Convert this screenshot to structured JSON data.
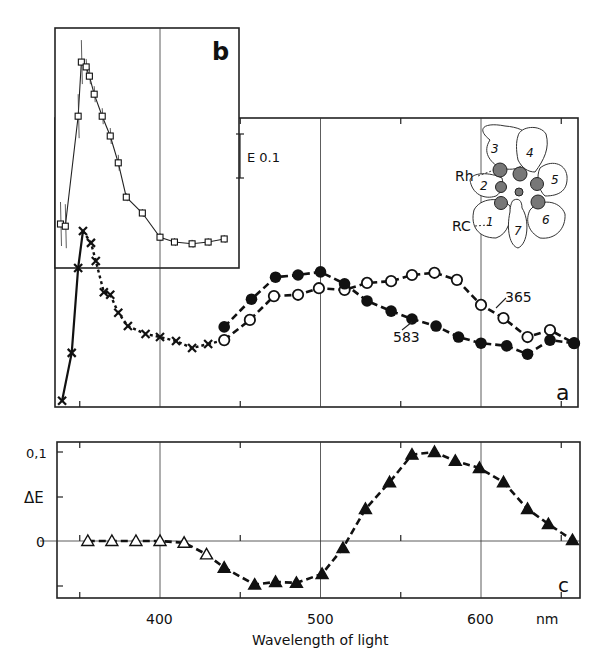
{
  "chart_data": [
    {
      "panel": "a",
      "type": "line",
      "title": "",
      "panel_label": "a",
      "xlabel": "Wavelength of light",
      "xunit": "nm",
      "ylabel": "E (relative extinction)",
      "xlim": [
        335,
        665
      ],
      "scale_bar": {
        "label": "E 0.1",
        "value": 0.1
      },
      "x_gridlines": [
        400,
        500,
        600
      ],
      "x_minor_ticks": [
        350,
        450,
        550,
        650
      ],
      "series": [
        {
          "name": "UV (x) both",
          "marker": "x",
          "x": [
            339,
            345,
            349,
            352,
            357,
            360,
            365,
            369,
            374,
            380,
            391,
            400,
            410,
            420,
            430
          ],
          "values": [
            0.014,
            0.123,
            0.316,
            0.4,
            0.373,
            0.332,
            0.261,
            0.255,
            0.214,
            0.184,
            0.166,
            0.159,
            0.15,
            0.134,
            0.143
          ]
        },
        {
          "name": "583",
          "marker": "filled-circle",
          "x": [
            440,
            457,
            472,
            486,
            500,
            515,
            529,
            544,
            557,
            572,
            586,
            600,
            616,
            629,
            643,
            658
          ],
          "values": [
            0.182,
            0.245,
            0.295,
            0.3,
            0.307,
            0.28,
            0.241,
            0.218,
            0.2,
            0.184,
            0.159,
            0.145,
            0.139,
            0.12,
            0.152,
            0.145
          ]
        },
        {
          "name": "365",
          "marker": "open-circle",
          "x": [
            440,
            456,
            471,
            486,
            499,
            515,
            529,
            544,
            557,
            571,
            585,
            600,
            614,
            629,
            643,
            658
          ],
          "values": [
            0.152,
            0.198,
            0.252,
            0.255,
            0.27,
            0.266,
            0.282,
            0.286,
            0.3,
            0.305,
            0.289,
            0.232,
            0.202,
            0.159,
            0.175,
            0.145
          ]
        }
      ],
      "annotations": [
        "365",
        "583",
        "Rh",
        "RC",
        "1",
        "2",
        "3",
        "4",
        "5",
        "6",
        "7"
      ]
    },
    {
      "panel": "b",
      "type": "line",
      "panel_label": "b",
      "xlabel": "Wavelength of light",
      "xunit": "nm",
      "ylabel": "E",
      "series": [
        {
          "name": "UV spectrum (inset)",
          "marker": "open-square",
          "error_bars": true,
          "x": [
            338,
            341,
            349,
            351,
            354,
            356,
            359,
            364,
            369,
            374,
            379,
            389,
            400,
            409,
            420,
            430,
            440
          ],
          "values": [
            0.1,
            0.095,
            0.345,
            0.468,
            0.457,
            0.436,
            0.395,
            0.345,
            0.3,
            0.239,
            0.161,
            0.125,
            0.07,
            0.059,
            0.055,
            0.059,
            0.066
          ]
        }
      ]
    },
    {
      "panel": "c",
      "type": "line",
      "panel_label": "c",
      "xlabel": "Wavelength of light",
      "xunit": "nm",
      "ylabel": "ΔE",
      "ylim": [
        -0.05,
        0.11
      ],
      "yticks": [
        0,
        0.1
      ],
      "ytick_labels": [
        "0",
        "0,1"
      ],
      "xticks": [
        400,
        500,
        600
      ],
      "xtick_labels": [
        "400",
        "500",
        "600"
      ],
      "series": [
        {
          "name": "Difference spectrum",
          "marker": "triangle",
          "x": [
            355,
            370,
            385,
            400,
            415,
            429,
            440,
            459,
            472,
            485,
            501,
            514,
            528,
            543,
            557,
            571,
            584,
            599,
            614,
            629,
            642,
            657
          ],
          "values": [
            0,
            0,
            0,
            0,
            -0.002,
            -0.015,
            -0.03,
            -0.049,
            -0.046,
            -0.047,
            -0.037,
            -0.008,
            0.036,
            0.066,
            0.097,
            0.1,
            0.09,
            0.082,
            0.066,
            0.036,
            0.019,
            0.001
          ],
          "filled_from_index": 6
        }
      ]
    }
  ],
  "labels": {
    "panel_a": "a",
    "panel_b": "b",
    "panel_c": "c",
    "scale_bar": "E 0.1",
    "series_365": "365",
    "series_583": "583",
    "rh": "Rh",
    "rc": "RC",
    "cells": [
      "1",
      "2",
      "3",
      "4",
      "5",
      "6",
      "7"
    ],
    "delta_e": "ΔE",
    "ytick_0": "0",
    "ytick_01": "0,1",
    "xtick_400": "400",
    "xtick_500": "500",
    "xtick_600": "600",
    "unit": "nm",
    "xlabel": "Wavelength of light"
  }
}
